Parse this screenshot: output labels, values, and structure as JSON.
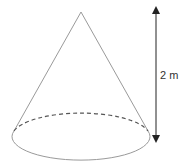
{
  "diagram": {
    "shape": "cone",
    "height_label": "2 m",
    "colors": {
      "outline": "#9a9a9a",
      "dashed_edge": "#555555",
      "arrow": "#222222",
      "text": "#333333"
    }
  }
}
